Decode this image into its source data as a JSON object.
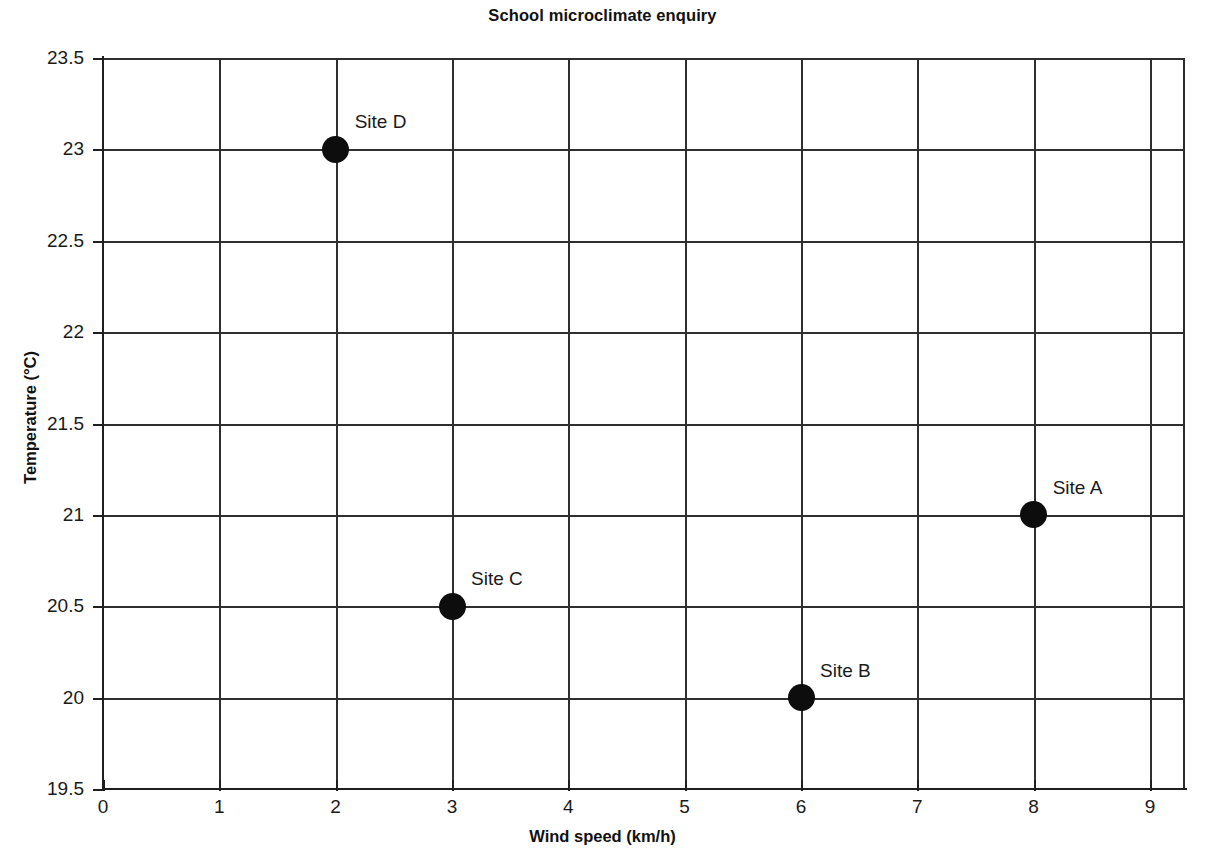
{
  "chart_data": {
    "type": "scatter",
    "title": "School microclimate enquiry",
    "xlabel": "Wind speed (km/h)",
    "ylabel": "Temperature (°C)",
    "xlim": [
      0,
      9
    ],
    "ylim": [
      19.5,
      23.5
    ],
    "x_ticks": [
      "0",
      "1",
      "2",
      "3",
      "4",
      "5",
      "6",
      "7",
      "8",
      "9"
    ],
    "y_ticks": [
      "19.5",
      "20",
      "20.5",
      "21",
      "21.5",
      "22",
      "22.5",
      "23",
      "23.5"
    ],
    "x_tick_values": [
      0,
      1,
      2,
      3,
      4,
      5,
      6,
      7,
      8,
      9
    ],
    "y_tick_values": [
      19.5,
      20,
      20.5,
      21,
      21.5,
      22,
      22.5,
      23,
      23.5
    ],
    "grid": true,
    "legend": false,
    "marker_color": "#0d0d0d",
    "grid_color": "#2f2f2f",
    "axis_color": "#1f1f1f",
    "background": "#ffffff",
    "points": [
      {
        "label": "Site A",
        "x": 8,
        "y": 21
      },
      {
        "label": "Site B",
        "x": 6,
        "y": 20
      },
      {
        "label": "Site C",
        "x": 3,
        "y": 20.5
      },
      {
        "label": "Site D",
        "x": 2,
        "y": 23
      }
    ]
  }
}
